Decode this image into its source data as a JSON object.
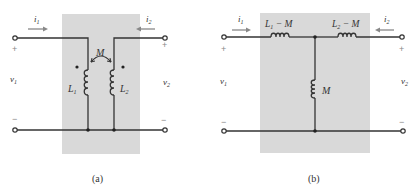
{
  "figure": {
    "panels": [
      {
        "id": "a",
        "caption": "(a)",
        "current_left": "i",
        "current_left_sub": "1",
        "current_right": "i",
        "current_right_sub": "2",
        "voltage_left": "v",
        "voltage_left_sub": "1",
        "voltage_right": "v",
        "voltage_right_sub": "2",
        "plus": "+",
        "minus": "−",
        "inductor_left": "L",
        "inductor_left_sub": "1",
        "inductor_right": "L",
        "inductor_right_sub": "2",
        "mutual": "M"
      },
      {
        "id": "b",
        "caption": "(b)",
        "current_left": "i",
        "current_left_sub": "1",
        "current_right": "i",
        "current_right_sub": "2",
        "voltage_left": "v",
        "voltage_left_sub": "1",
        "voltage_right": "v",
        "voltage_right_sub": "2",
        "plus": "+",
        "minus": "−",
        "series_left": "L",
        "series_left_sub": "1",
        "series_left_tail": " − M",
        "series_right": "L",
        "series_right_sub": "2",
        "series_right_tail": " − M",
        "shunt": "M"
      }
    ],
    "colors": {
      "box": "#d9d9d9",
      "wire": "#333333",
      "arrow": "#888888"
    }
  }
}
